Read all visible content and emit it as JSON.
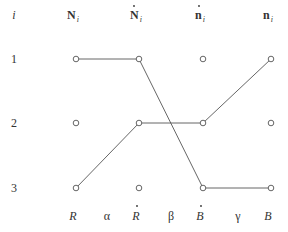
{
  "diagram": {
    "index_header": "i",
    "column_headers": [
      {
        "base": "N",
        "dot": false,
        "sub": "i"
      },
      {
        "base": "N",
        "dot": true,
        "sub": "i"
      },
      {
        "base": "n",
        "dot": true,
        "sub": "i"
      },
      {
        "base": "n",
        "dot": false,
        "sub": "i"
      }
    ],
    "row_labels": [
      "1",
      "2",
      "3"
    ],
    "bottom_labels": [
      {
        "text": "R",
        "kind": "column",
        "dot": false
      },
      {
        "text": "α",
        "kind": "between",
        "dot": false
      },
      {
        "text": "R",
        "kind": "column",
        "dot": true
      },
      {
        "text": "β",
        "kind": "between",
        "dot": false
      },
      {
        "text": "B",
        "kind": "column",
        "dot": true
      },
      {
        "text": "γ",
        "kind": "between",
        "dot": false
      },
      {
        "text": "B",
        "kind": "column",
        "dot": false
      }
    ],
    "edges": [
      {
        "from": [
          0,
          0
        ],
        "to": [
          1,
          0
        ]
      },
      {
        "from": [
          1,
          0
        ],
        "to": [
          2,
          2
        ]
      },
      {
        "from": [
          2,
          2
        ],
        "to": [
          3,
          2
        ]
      },
      {
        "from": [
          0,
          2
        ],
        "to": [
          1,
          1
        ]
      },
      {
        "from": [
          1,
          1
        ],
        "to": [
          2,
          1
        ]
      },
      {
        "from": [
          2,
          1
        ],
        "to": [
          3,
          0
        ]
      }
    ]
  }
}
